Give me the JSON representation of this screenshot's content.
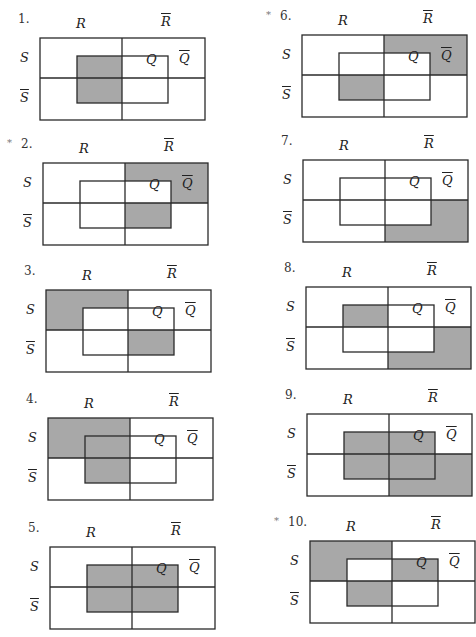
{
  "labels": {
    "R": "R",
    "R_bar": "R",
    "S": "S",
    "S_bar": "S",
    "Q": "Q",
    "Q_bar": "Q"
  },
  "colors": {
    "shade": "#a8a8a8",
    "line": "#2a2a2a"
  },
  "region_legend": "Regions are named by S-row (S / notS), R-column (R / notR), and inside (Q) or outside (notQ) the inner box",
  "diagrams": [
    {
      "number": "1.",
      "starred": false,
      "shaded": [
        "S_R_Q",
        "notS_R_Q"
      ]
    },
    {
      "number": "2.",
      "starred": true,
      "shaded": [
        "S_notR_notQ",
        "notS_notR_Q"
      ]
    },
    {
      "number": "3.",
      "starred": false,
      "shaded": [
        "S_R_notQ",
        "notS_notR_Q"
      ]
    },
    {
      "number": "4.",
      "starred": false,
      "shaded": [
        "S_R_notQ",
        "S_R_Q",
        "notS_R_Q"
      ]
    },
    {
      "number": "5.",
      "starred": false,
      "shaded": [
        "S_R_Q",
        "S_notR_Q",
        "notS_R_Q",
        "notS_notR_Q"
      ]
    },
    {
      "number": "6.",
      "starred": true,
      "shaded": [
        "S_notR_notQ",
        "notS_R_Q"
      ]
    },
    {
      "number": "7.",
      "starred": false,
      "shaded": [
        "notS_notR_notQ"
      ]
    },
    {
      "number": "8.",
      "starred": false,
      "shaded": [
        "S_R_Q",
        "notS_notR_notQ"
      ]
    },
    {
      "number": "9.",
      "starred": false,
      "shaded": [
        "S_R_Q",
        "S_notR_Q",
        "notS_R_Q",
        "notS_notR_Q",
        "notS_notR_notQ"
      ]
    },
    {
      "number": "10.",
      "starred": true,
      "shaded": [
        "S_R_notQ",
        "S_notR_Q",
        "notS_R_Q"
      ]
    }
  ],
  "star_glyph": "*"
}
